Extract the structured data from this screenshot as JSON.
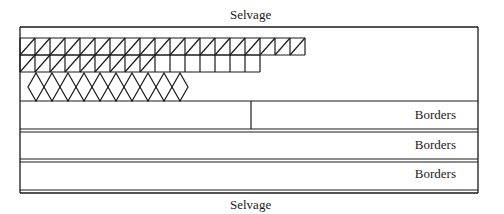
{
  "labels": {
    "top_selvage": "Selvage",
    "bottom_selvage": "Selvage",
    "borders": [
      "Borders",
      "Borders",
      "Borders"
    ]
  },
  "frame": {
    "left": 20,
    "right": 478,
    "top": 27,
    "bottom": 193
  },
  "pattern": {
    "cell_width": 15,
    "row1": {
      "y_top": 38,
      "y_bottom": 55,
      "cells": 19,
      "diagonal_cells": 19
    },
    "row2": {
      "y_top": 55,
      "y_bottom": 72,
      "cells": 16,
      "diagonal_cells": 9
    },
    "diamonds": {
      "count": 10,
      "y_top": 73,
      "y_bottom": 101,
      "x_start": 28,
      "width": 16
    }
  },
  "border_rows": [
    {
      "y_top": 101,
      "y_bottom": 129,
      "divider_x": 251
    },
    {
      "y_top": 132,
      "y_bottom": 159
    },
    {
      "y_top": 162,
      "y_bottom": 190
    }
  ],
  "colors": {
    "line": "#1a1a1a",
    "background": "#ffffff"
  }
}
